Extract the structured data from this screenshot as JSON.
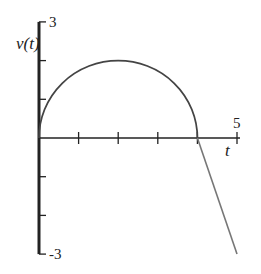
{
  "chart_data": {
    "type": "line",
    "title": "",
    "xlabel": "t",
    "ylabel": "v(t)",
    "xlim": [
      0,
      5
    ],
    "ylim": [
      -3,
      3
    ],
    "x_ticks": [
      0,
      1,
      2,
      3,
      4,
      5
    ],
    "y_ticks": [
      -3,
      -2,
      -1,
      0,
      1,
      2,
      3
    ],
    "x_tick_labels": [
      {
        "value": 5,
        "label": "5"
      }
    ],
    "y_tick_labels": [
      {
        "value": 3,
        "label": "3"
      },
      {
        "value": -3,
        "label": "-3"
      }
    ],
    "grid": false,
    "series": [
      {
        "name": "semicircle",
        "kind": "semicircle",
        "center": [
          2,
          0
        ],
        "radius_t": 2,
        "radius_v": 2,
        "from_t": 0,
        "to_t": 4
      },
      {
        "name": "line",
        "kind": "segment",
        "points": [
          [
            4,
            0
          ],
          [
            5,
            -3
          ]
        ]
      }
    ],
    "colors": {
      "axis": "#222222",
      "curve": "#444444",
      "segment": "#777777"
    }
  }
}
